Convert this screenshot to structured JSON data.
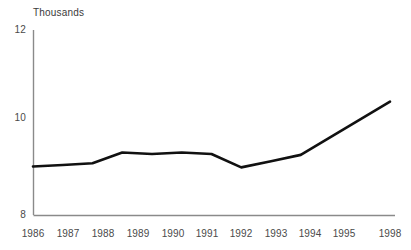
{
  "chart_data": {
    "type": "line",
    "title": "Thousands",
    "subtitle": "",
    "xlabel": "",
    "ylabel": "",
    "ylim": [
      8,
      12
    ],
    "ytick_labels": [
      "12",
      "10",
      "8"
    ],
    "ytick_values": [
      12,
      10,
      8
    ],
    "grid": false,
    "legend": null,
    "x": [
      1986,
      1987,
      1988,
      1989,
      1990,
      1991,
      1992,
      1993,
      1994,
      1995,
      1998
    ],
    "xtick_labels": [
      "1986",
      "1987",
      "1988",
      "1989",
      "1990",
      "1991",
      "1992",
      "1993",
      "1994",
      "1995",
      "1998"
    ],
    "series": [
      {
        "name": "",
        "color": "#111111",
        "values": [
          9.05,
          9.08,
          9.12,
          9.35,
          9.32,
          9.35,
          9.32,
          9.03,
          9.16,
          9.3,
          10.45
        ]
      }
    ]
  },
  "axes": {
    "axis_color": "#8a8a8a",
    "line_color": "#111111"
  }
}
